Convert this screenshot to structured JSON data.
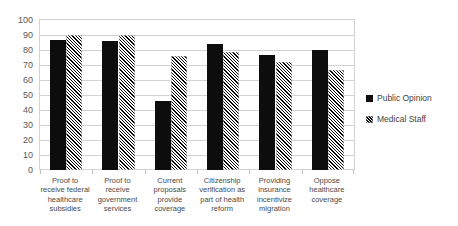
{
  "chart_data": {
    "type": "bar",
    "title": "",
    "subtitle": "",
    "xlabel": "",
    "ylabel": "",
    "ylim": [
      0,
      100
    ],
    "ytick_step": 10,
    "yticks": [
      100,
      90,
      80,
      70,
      60,
      50,
      40,
      30,
      20,
      10,
      0
    ],
    "grid": true,
    "grid_axis": "y",
    "legend_position": "right",
    "categories": [
      "Proof to receive federal healthcare subsidies",
      "Proof to receive government services",
      "Current proposals provide coverage",
      "Citizenship verification as part of health reform",
      "Providing insurance incentivize migration",
      "Oppose healthcare coverage"
    ],
    "series": [
      {
        "name": "Public Opinion",
        "pattern": "solid",
        "color": "#0d0d0d",
        "values": [
          87,
          86,
          46,
          84,
          77,
          80
        ]
      },
      {
        "name": "Medical Staff",
        "pattern": "diagonal-hatch",
        "color": "#000000",
        "values": [
          90,
          90,
          76,
          79,
          72,
          67
        ]
      }
    ]
  },
  "legend": {
    "items": [
      {
        "label": "Public Opinion",
        "swatch": "solid-square-icon"
      },
      {
        "label": "Medical Staff",
        "swatch": "hatched-square-icon"
      }
    ]
  }
}
